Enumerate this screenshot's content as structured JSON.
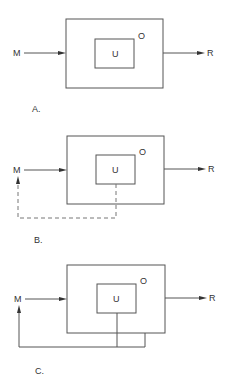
{
  "diagrams": [
    {
      "caption": "A.",
      "input_label": "M",
      "output_label": "R",
      "outer_label": "O",
      "inner_label": "U",
      "feedback": "none"
    },
    {
      "caption": "B.",
      "input_label": "M",
      "output_label": "R",
      "outer_label": "O",
      "inner_label": "U",
      "feedback": "dashed from U to M"
    },
    {
      "caption": "C.",
      "input_label": "M",
      "output_label": "R",
      "outer_label": "O",
      "inner_label": "U",
      "feedback": "solid from U and O to M"
    }
  ],
  "colors": {
    "stroke": "#555555",
    "text": "#333333",
    "background": "#ffffff"
  }
}
